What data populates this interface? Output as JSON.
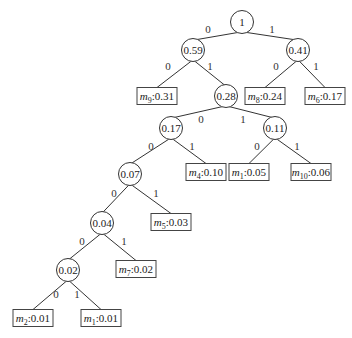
{
  "diagram": {
    "type": "binary-coding-tree",
    "internal_nodes": [
      {
        "id": "n_root",
        "label": "1",
        "x": 242,
        "y": 22
      },
      {
        "id": "n059",
        "label": "0.59",
        "x": 193,
        "y": 50
      },
      {
        "id": "n041",
        "label": "0.41",
        "x": 298,
        "y": 50
      },
      {
        "id": "n028",
        "label": "0.28",
        "x": 226,
        "y": 96
      },
      {
        "id": "n017",
        "label": "0.17",
        "x": 171,
        "y": 128
      },
      {
        "id": "n011",
        "label": "0.11",
        "x": 275,
        "y": 128
      },
      {
        "id": "n007",
        "label": "0.07",
        "x": 130,
        "y": 174
      },
      {
        "id": "n004",
        "label": "0.04",
        "x": 102,
        "y": 223
      },
      {
        "id": "n002",
        "label": "0.02",
        "x": 68,
        "y": 270
      }
    ],
    "leaves": [
      {
        "id": "l_m9",
        "sym": "m",
        "sub": "9",
        "value": "0.31",
        "x": 157,
        "y": 96
      },
      {
        "id": "l_m8",
        "sym": "m",
        "sub": "8",
        "value": "0.24",
        "x": 265,
        "y": 96
      },
      {
        "id": "l_m6",
        "sym": "m",
        "sub": "6",
        "value": "0.17",
        "x": 325,
        "y": 96
      },
      {
        "id": "l_m4",
        "sym": "m",
        "sub": "4",
        "value": "0.10",
        "x": 206,
        "y": 172
      },
      {
        "id": "l_m1a",
        "sym": "m",
        "sub": "1",
        "value": "0.05",
        "x": 249,
        "y": 172
      },
      {
        "id": "l_m10",
        "sym": "m",
        "sub": "10",
        "value": "0.06",
        "x": 311,
        "y": 172
      },
      {
        "id": "l_m5",
        "sym": "m",
        "sub": "5",
        "value": "0.03",
        "x": 171,
        "y": 222
      },
      {
        "id": "l_m7",
        "sym": "m",
        "sub": "7",
        "value": "0.02",
        "x": 136,
        "y": 269
      },
      {
        "id": "l_m2",
        "sym": "m",
        "sub": "2",
        "value": "0.01",
        "x": 33,
        "y": 318
      },
      {
        "id": "l_m1b",
        "sym": "m",
        "sub": "1",
        "value": "0.01",
        "x": 101,
        "y": 318
      }
    ],
    "edges": [
      {
        "from": "n_root",
        "to": "n059",
        "label": "0",
        "lx": 208,
        "ly": 33
      },
      {
        "from": "n_root",
        "to": "n041",
        "label": "1",
        "lx": 272,
        "ly": 33
      },
      {
        "from": "n059",
        "to": "l_m9",
        "label": "0",
        "lx": 168,
        "ly": 70
      },
      {
        "from": "n059",
        "to": "n028",
        "label": "1",
        "lx": 210,
        "ly": 70
      },
      {
        "from": "n041",
        "to": "l_m8",
        "label": "0",
        "lx": 276,
        "ly": 70
      },
      {
        "from": "n041",
        "to": "l_m6",
        "label": "1",
        "lx": 316,
        "ly": 70
      },
      {
        "from": "n028",
        "to": "n017",
        "label": "0",
        "lx": 201,
        "ly": 123
      },
      {
        "from": "n028",
        "to": "n011",
        "label": "1",
        "lx": 243,
        "ly": 123
      },
      {
        "from": "n017",
        "to": "l_m4",
        "label": "1",
        "lx": 192,
        "ly": 150
      },
      {
        "from": "n017",
        "to": "n007",
        "label": "0",
        "lx": 151,
        "ly": 150
      },
      {
        "from": "n011",
        "to": "l_m1a",
        "label": "0",
        "lx": 257,
        "ly": 150
      },
      {
        "from": "n011",
        "to": "l_m10",
        "label": "1",
        "lx": 297,
        "ly": 150
      },
      {
        "from": "n007",
        "to": "n004",
        "label": "0",
        "lx": 114,
        "ly": 197
      },
      {
        "from": "n007",
        "to": "l_m5",
        "label": "1",
        "lx": 156,
        "ly": 197
      },
      {
        "from": "n004",
        "to": "n002",
        "label": "0",
        "lx": 82,
        "ly": 245
      },
      {
        "from": "n004",
        "to": "l_m7",
        "label": "1",
        "lx": 124,
        "ly": 245
      },
      {
        "from": "n002",
        "to": "l_m2",
        "label": "0",
        "lx": 56,
        "ly": 298
      },
      {
        "from": "n002",
        "to": "l_m1b",
        "label": "1",
        "lx": 77,
        "ly": 298
      }
    ]
  }
}
